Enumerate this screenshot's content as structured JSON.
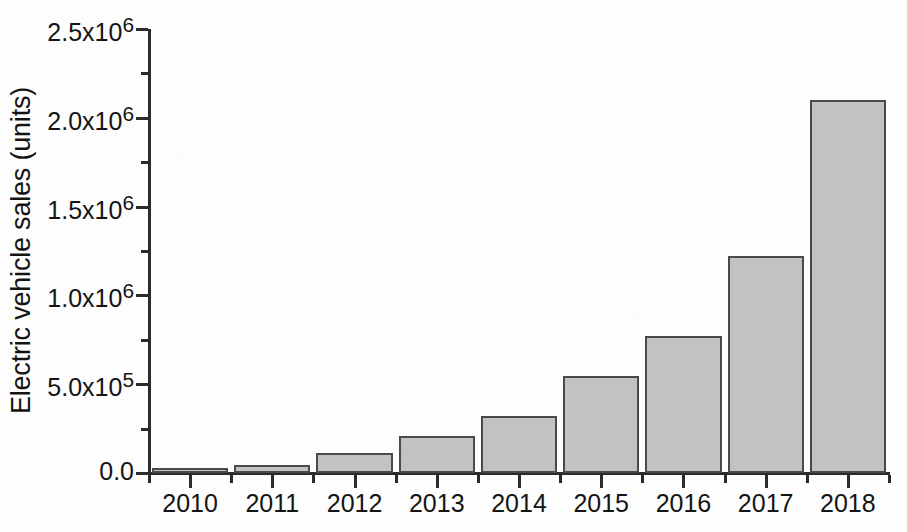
{
  "chart_data": {
    "type": "bar",
    "title": "",
    "xlabel": "",
    "ylabel": "Electric vehicle sales (units)",
    "categories": [
      "2010",
      "2011",
      "2012",
      "2013",
      "2014",
      "2015",
      "2016",
      "2017",
      "2018"
    ],
    "values": [
      17000,
      45000,
      113000,
      208000,
      320000,
      547000,
      772000,
      1223000,
      2098000
    ],
    "ylim": [
      0,
      2500000
    ],
    "y_major_ticks": [
      0,
      500000,
      1000000,
      1500000,
      2000000,
      2500000
    ],
    "y_tick_labels": [
      "0.0",
      "5.0x10^5",
      "1.0x10^6",
      "1.5x10^6",
      "2.0x10^6",
      "2.5x10^6"
    ],
    "y_minor_ticks": [
      250000,
      750000,
      1250000,
      1750000,
      2250000
    ],
    "grid": false,
    "legend": null,
    "bar_fill_color": "#c2c2c2",
    "bar_edge_color": "#4a4a4a",
    "axis_color": "#2b2b2b",
    "background_color": "#fdfdfd"
  },
  "axes": {
    "y_title": "Electric vehicle sales (units)",
    "y_ticks": [
      {
        "label_mantissa": "2.5x10",
        "label_exponent": "6",
        "value": 2500000
      },
      {
        "label_mantissa": "2.0x10",
        "label_exponent": "6",
        "value": 2000000
      },
      {
        "label_mantissa": "1.5x10",
        "label_exponent": "6",
        "value": 1500000
      },
      {
        "label_mantissa": "1.0x10",
        "label_exponent": "6",
        "value": 1000000
      },
      {
        "label_mantissa": "5.0x10",
        "label_exponent": "5",
        "value": 500000
      },
      {
        "label_mantissa": "0.0",
        "label_exponent": "",
        "value": 0
      }
    ],
    "x_ticks": [
      {
        "label": "2010",
        "value": 2010
      },
      {
        "label": "2011",
        "value": 2011
      },
      {
        "label": "2012",
        "value": 2012
      },
      {
        "label": "2013",
        "value": 2013
      },
      {
        "label": "2014",
        "value": 2014
      },
      {
        "label": "2015",
        "value": 2015
      },
      {
        "label": "2016",
        "value": 2016
      },
      {
        "label": "2017",
        "value": 2017
      },
      {
        "label": "2018",
        "value": 2018
      }
    ]
  }
}
